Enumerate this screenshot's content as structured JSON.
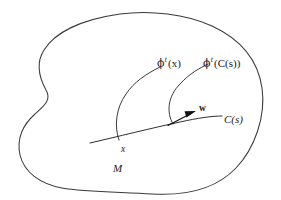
{
  "figure": {
    "kind": "mathematical-diagram",
    "background_color": "#ffffff",
    "stroke_color": "#3a3a3a",
    "text_color": "#1a1a1a",
    "width": 281,
    "height": 200
  },
  "labels": {
    "manifold": "M",
    "base_point": "x",
    "base_curve": "C(s)",
    "tangent_vector": "w",
    "flow_of_point": {
      "phi": "ϕ",
      "superscript": "t",
      "argument": "(x)",
      "full": "ϕᵗ(x)"
    },
    "flow_of_curve": {
      "phi": "ϕ",
      "superscript": "t",
      "argument": "(C(s))",
      "full": "ϕᵗ(C(s))"
    }
  },
  "geometry": {
    "manifold_outline": "M 120,14 C 150,10 186,14 212,26 C 240,39 258,60 262,88 C 266,116 255,148 236,168 C 216,189 186,196 152,194 C 118,192 84,192 62,188 C 40,184 24,172 20,155 C 16,138 24,124 34,115 C 44,106 52,100 46,90 C 40,79 35,64 44,50 C 54,34 78,20 120,14 Z",
    "base_curve": "M 90,143 C 116,137 152,128 180,122 C 198,118 212,116 222,116",
    "flow_curve_left": "M 119,140 C 114,126 116,108 126,94 C 134,82 146,74 160,67",
    "flow_curve_right": "M 173,124 C 166,112 168,96 180,84 C 190,73 200,68 208,64",
    "vector_arrow": {
      "x1": 168,
      "y1": 125,
      "x2": 193,
      "y2": 113
    }
  },
  "label_positions": {
    "flow_of_point": {
      "left": 157,
      "top": 56
    },
    "flow_of_curve": {
      "left": 203,
      "top": 56
    },
    "tangent_vector": {
      "left": 199,
      "top": 104
    },
    "base_curve": {
      "left": 222,
      "top": 115
    },
    "base_point": {
      "left": 121,
      "top": 145
    },
    "manifold": {
      "left": 113,
      "top": 163
    }
  }
}
